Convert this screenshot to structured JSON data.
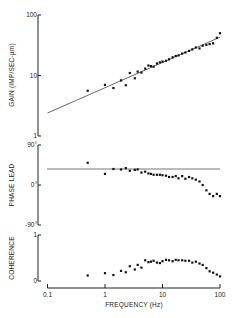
{
  "chart_data": [
    {
      "panel": "gain",
      "type": "scatter",
      "ylabel": "GAIN (IMP/SEC-µm)",
      "yscale": "log",
      "ylim": [
        1,
        100
      ],
      "yticks": [
        "1",
        "10",
        "100"
      ],
      "xscale": "log",
      "xlim": [
        0.1,
        100
      ],
      "fit_line": {
        "x": [
          0.1,
          100
        ],
        "y": [
          2.4,
          43
        ]
      },
      "x": [
        0.5,
        1.0,
        1.4,
        1.9,
        2.3,
        2.7,
        3.3,
        3.7,
        4.3,
        5.0,
        5.7,
        6.3,
        7.0,
        8.0,
        9.0,
        10,
        11.5,
        13,
        15,
        17,
        19,
        22,
        25,
        29,
        33,
        38,
        44,
        50,
        58,
        66,
        76,
        88,
        100
      ],
      "y": [
        5.6,
        7.0,
        6.2,
        8.3,
        6.9,
        11.0,
        9.0,
        11.6,
        11.2,
        13.0,
        14.6,
        14.3,
        14.0,
        15.8,
        16.5,
        17.0,
        17.5,
        18.5,
        20.0,
        21.0,
        21.5,
        23.0,
        24.0,
        25.5,
        27.0,
        29.0,
        28.0,
        31.0,
        32.0,
        33.0,
        34.0,
        42.0,
        50.0
      ]
    },
    {
      "panel": "phase",
      "type": "scatter",
      "ylabel": "PHASE LEAD",
      "ylim": [
        -90,
        90
      ],
      "yticks": [
        "-90°",
        "0°",
        "90°"
      ],
      "xscale": "log",
      "xlim": [
        0.1,
        100
      ],
      "reference_line": 36,
      "x": [
        0.5,
        1.0,
        1.4,
        1.9,
        2.3,
        2.7,
        3.3,
        3.7,
        4.3,
        5.0,
        5.7,
        6.3,
        7.0,
        8.0,
        9.0,
        10,
        11.5,
        13,
        15,
        17,
        19,
        22,
        25,
        29,
        33,
        38,
        44,
        50,
        58,
        66,
        76,
        88,
        100
      ],
      "y": [
        50,
        25,
        36,
        35,
        38,
        32,
        34,
        35,
        28,
        30,
        26,
        25,
        23,
        23,
        23,
        22,
        21,
        18,
        18,
        20,
        15,
        20,
        14,
        18,
        15,
        12,
        8,
        0,
        -12,
        -20,
        -25,
        -20,
        -25
      ]
    },
    {
      "panel": "coherence",
      "type": "scatter",
      "ylabel": "COHERENCE",
      "ylim": [
        0,
        1
      ],
      "yticks": [
        "0",
        "1"
      ],
      "xlabel": "FREQUENCY (Hz)",
      "xscale": "log",
      "xlim": [
        0.1,
        100
      ],
      "xticks": [
        "0.1",
        "1",
        "10",
        "100"
      ],
      "x": [
        0.5,
        1.0,
        1.4,
        1.9,
        2.3,
        2.7,
        3.3,
        3.7,
        4.3,
        5.0,
        5.7,
        6.3,
        7.0,
        8.0,
        9.0,
        10,
        11.5,
        13,
        15,
        17,
        19,
        22,
        25,
        29,
        33,
        38,
        44,
        50,
        58,
        66,
        76,
        88,
        100
      ],
      "y": [
        0.12,
        0.17,
        0.13,
        0.22,
        0.19,
        0.32,
        0.25,
        0.35,
        0.29,
        0.45,
        0.41,
        0.42,
        0.44,
        0.4,
        0.39,
        0.43,
        0.46,
        0.45,
        0.43,
        0.46,
        0.45,
        0.45,
        0.44,
        0.44,
        0.4,
        0.42,
        0.38,
        0.35,
        0.28,
        0.21,
        0.18,
        0.14,
        0.1
      ]
    }
  ],
  "labels": {
    "gain_axis": "GAIN (IMP/SEC-µm)",
    "phase_axis": "PHASE LEAD",
    "coherence_axis": "COHERENCE",
    "x_axis": "FREQUENCY (Hz)",
    "gain_ticks": [
      "100",
      "10",
      "1"
    ],
    "phase_ticks": [
      "90°",
      "0°",
      "-90°"
    ],
    "coherence_ticks": [
      "1",
      "0"
    ],
    "x_ticks": [
      "0.1",
      "1",
      "10",
      "100"
    ]
  }
}
